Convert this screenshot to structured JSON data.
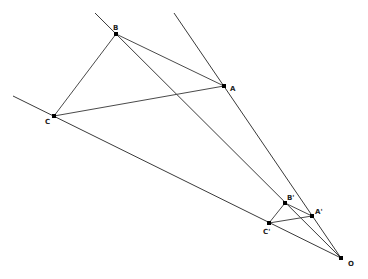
{
  "diagram": {
    "title": "",
    "center": {
      "id": "O",
      "label": "O"
    },
    "points": [
      {
        "id": "A",
        "label": "A"
      },
      {
        "id": "B",
        "label": "B"
      },
      {
        "id": "C",
        "label": "C"
      },
      {
        "id": "A'",
        "label": "A'"
      },
      {
        "id": "B'",
        "label": "B'"
      },
      {
        "id": "C'",
        "label": "C'"
      },
      {
        "id": "O",
        "label": "O"
      }
    ],
    "rays": [
      {
        "from": "O",
        "through": "A"
      },
      {
        "from": "O",
        "through": "B"
      },
      {
        "from": "O",
        "through": "C"
      }
    ],
    "triangles": [
      {
        "vertices": [
          "A",
          "B",
          "C"
        ]
      },
      {
        "vertices": [
          "A'",
          "B'",
          "C'"
        ]
      }
    ],
    "colors": {
      "line": "#3a3a3a",
      "point": "#000000",
      "label": "#222222",
      "background": "#ffffff"
    }
  }
}
